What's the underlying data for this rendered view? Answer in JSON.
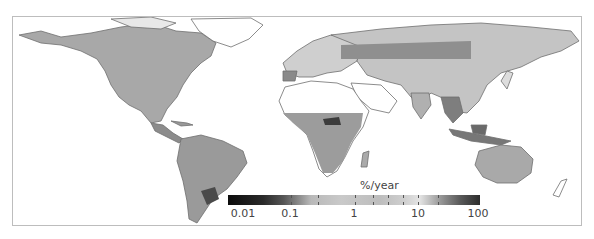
{
  "figure": {
    "type": "world-map",
    "frame_color": "#bdbdbd",
    "coastline_color": "#6e6e6e"
  },
  "colorbar": {
    "label": "%/year",
    "scale": "log",
    "ticks": [
      "0.01",
      "0.1",
      "1",
      "10",
      "100"
    ],
    "range": [
      0.01,
      100
    ],
    "colormap": "grayscale: black (low) → light gray (mid) → dark gray (high)"
  },
  "regions": [
    {
      "name": "North America",
      "shade": "mixed mid-to-dark gray"
    },
    {
      "name": "South America",
      "shade": "mid gray, darker in southeast"
    },
    {
      "name": "Europe",
      "shade": "light gray"
    },
    {
      "name": "Russia / Central Asia",
      "shade": "mid gray band"
    },
    {
      "name": "Sub-Saharan Africa",
      "shade": "mid gray, dark patches"
    },
    {
      "name": "Sahara / Arabia",
      "shade": "white (no data)"
    },
    {
      "name": "South & Southeast Asia",
      "shade": "mid-dark gray"
    },
    {
      "name": "Australia",
      "shade": "light-mid gray"
    }
  ]
}
